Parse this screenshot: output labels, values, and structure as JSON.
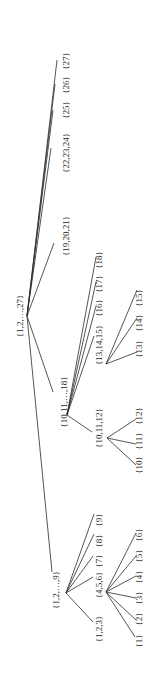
{
  "diagram": {
    "type": "tree",
    "orientation": "rotated-90-ccw",
    "stroke_color": "#2a2a2a",
    "background": "#ffffff",
    "nodes": [
      {
        "id": "root",
        "label": "{1,2,…,27}",
        "x": 20,
        "y": 316,
        "jx": 27,
        "jy": 316
      },
      {
        "id": "n27",
        "label": "{27}",
        "x": 66,
        "y": 61,
        "ex": 57,
        "ey": 60
      },
      {
        "id": "n26",
        "label": "{26}",
        "x": 66,
        "y": 85,
        "ex": 55,
        "ey": 84
      },
      {
        "id": "n25",
        "label": "{25}",
        "x": 66,
        "y": 110,
        "ex": 53,
        "ey": 110
      },
      {
        "id": "n22_24",
        "label": "{22,23,24}",
        "x": 66,
        "y": 153,
        "ex": 51,
        "ey": 148
      },
      {
        "id": "n19_21",
        "label": "{19,20,21}",
        "x": 66,
        "y": 236,
        "ex": 54,
        "ey": 243
      },
      {
        "id": "n10_18",
        "label": "{10,11,…,18}",
        "x": 64,
        "y": 402,
        "ex": 53,
        "ey": 392,
        "jx": 67,
        "jy": 415
      },
      {
        "id": "n18",
        "label": "{18}",
        "x": 99,
        "y": 260,
        "ex": 96,
        "ey": 257
      },
      {
        "id": "n17",
        "label": "{17}",
        "x": 99,
        "y": 284,
        "ex": 96,
        "ey": 282
      },
      {
        "id": "n16",
        "label": "{16}",
        "x": 99,
        "y": 308,
        "ex": 96,
        "ey": 306
      },
      {
        "id": "n13_15",
        "label": "{13,14,15}",
        "x": 99,
        "y": 345,
        "ex": 94,
        "ey": 336,
        "jx": 106,
        "jy": 364
      },
      {
        "id": "n15",
        "label": "{15}",
        "x": 139,
        "y": 298,
        "ex": 137,
        "ey": 290
      },
      {
        "id": "n14",
        "label": "{14}",
        "x": 139,
        "y": 323,
        "ex": 137,
        "ey": 318
      },
      {
        "id": "n13",
        "label": "{13}",
        "x": 139,
        "y": 349,
        "ex": 137,
        "ey": 352
      },
      {
        "id": "n10_12",
        "label": "{10,11,12}",
        "x": 99,
        "y": 428,
        "ex": 92,
        "ey": 432,
        "jx": 107,
        "jy": 438
      },
      {
        "id": "n12",
        "label": "{12}",
        "x": 139,
        "y": 416,
        "ex": 136,
        "ey": 419
      },
      {
        "id": "n11",
        "label": "{11}",
        "x": 139,
        "y": 441,
        "ex": 136,
        "ey": 444
      },
      {
        "id": "n10",
        "label": "{10}",
        "x": 139,
        "y": 465,
        "ex": 136,
        "ey": 465
      },
      {
        "id": "n1_9",
        "label": "{1,2,…,9}",
        "x": 56,
        "y": 590,
        "ex": 52,
        "ey": 572,
        "jx": 66,
        "jy": 593
      },
      {
        "id": "n9",
        "label": "{9}",
        "x": 99,
        "y": 520,
        "ex": 94,
        "ey": 514
      },
      {
        "id": "n8",
        "label": "{8}",
        "x": 99,
        "y": 541,
        "ex": 94,
        "ey": 534
      },
      {
        "id": "n7",
        "label": "{7}",
        "x": 99,
        "y": 561,
        "ex": 93,
        "ey": 556
      },
      {
        "id": "n4_6",
        "label": "{4,5,6}",
        "x": 99,
        "y": 585,
        "ex": 93,
        "ey": 577,
        "jx": 106,
        "jy": 592
      },
      {
        "id": "n1_3",
        "label": "{1,2,3}",
        "x": 99,
        "y": 629,
        "ex": 93,
        "ey": 622
      },
      {
        "id": "n6",
        "label": "{6}",
        "x": 139,
        "y": 535,
        "ex": 136,
        "ey": 533
      },
      {
        "id": "n5",
        "label": "{5}",
        "x": 139,
        "y": 556,
        "ex": 136,
        "ey": 556
      },
      {
        "id": "n4",
        "label": "{4}",
        "x": 139,
        "y": 577,
        "ex": 136,
        "ey": 576
      },
      {
        "id": "n3",
        "label": "{3}",
        "x": 139,
        "y": 598,
        "ex": 136,
        "ey": 598
      },
      {
        "id": "n2",
        "label": "{2}",
        "x": 139,
        "y": 619,
        "ex": 136,
        "ey": 620
      },
      {
        "id": "n1",
        "label": "{1}",
        "x": 139,
        "y": 641,
        "ex": 135,
        "ey": 637
      }
    ],
    "edges": [
      [
        "root",
        "n27"
      ],
      [
        "root",
        "n26"
      ],
      [
        "root",
        "n25"
      ],
      [
        "root",
        "n22_24"
      ],
      [
        "root",
        "n19_21"
      ],
      [
        "root",
        "n10_18"
      ],
      [
        "root",
        "n1_9"
      ],
      [
        "n10_18",
        "n18"
      ],
      [
        "n10_18",
        "n17"
      ],
      [
        "n10_18",
        "n16"
      ],
      [
        "n10_18",
        "n13_15"
      ],
      [
        "n10_18",
        "n10_12"
      ],
      [
        "n13_15",
        "n15"
      ],
      [
        "n13_15",
        "n14"
      ],
      [
        "n13_15",
        "n13"
      ],
      [
        "n10_12",
        "n12"
      ],
      [
        "n10_12",
        "n11"
      ],
      [
        "n10_12",
        "n10"
      ],
      [
        "n1_9",
        "n9"
      ],
      [
        "n1_9",
        "n8"
      ],
      [
        "n1_9",
        "n7"
      ],
      [
        "n1_9",
        "n4_6"
      ],
      [
        "n1_9",
        "n1_3"
      ],
      [
        "n4_6",
        "n6"
      ],
      [
        "n4_6",
        "n5"
      ],
      [
        "n4_6",
        "n4"
      ],
      [
        "n4_6",
        "n3"
      ],
      [
        "n4_6",
        "n2"
      ],
      [
        "n4_6",
        "n1"
      ]
    ]
  }
}
